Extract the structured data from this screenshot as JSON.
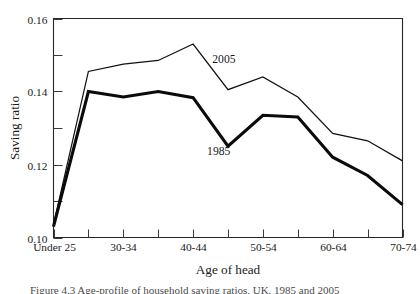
{
  "figure": {
    "caption_partial": "Figure 4.3  Age-profile of household saving ratios, UK, 1985 and 2005"
  },
  "chart_data": {
    "type": "line",
    "title": "",
    "xlabel": "Age of head",
    "ylabel": "Saving ratio",
    "grid": false,
    "legend": "inline-labels",
    "xlim": [
      0,
      10
    ],
    "ylim": [
      0.1,
      0.16
    ],
    "ytick_values": [
      0.1,
      0.12,
      0.14,
      0.16
    ],
    "ytick_labels": [
      "0.10",
      "0.12",
      "0.14",
      "0.16"
    ],
    "yminor_values": [
      0.11,
      0.13,
      0.15
    ],
    "categories": [
      "Under 25",
      "25-29",
      "30-34",
      "35-39",
      "40-44",
      "45-49",
      "50-54",
      "55-59",
      "60-64",
      "65-69",
      "70-74"
    ],
    "xtick_labels_shown": [
      "Under 25",
      "",
      "30-34",
      "",
      "40-44",
      "",
      "50-54",
      "",
      "60-64",
      "",
      "70-74"
    ],
    "series": [
      {
        "name": "2005",
        "style": "thin",
        "label_text": "2005",
        "values": [
          0.1035,
          0.1455,
          0.1475,
          0.1485,
          0.153,
          0.1405,
          0.144,
          0.1385,
          0.1285,
          0.1265,
          0.121
        ]
      },
      {
        "name": "1985",
        "style": "thick",
        "label_text": "1985",
        "values": [
          0.103,
          0.14,
          0.1385,
          0.14,
          0.1383,
          0.125,
          0.1335,
          0.133,
          0.122,
          0.117,
          0.109
        ]
      }
    ],
    "annotations": [
      {
        "text": "2005",
        "x_index": 4.55,
        "y_value": 0.1478
      },
      {
        "text": "1985",
        "x_index": 4.4,
        "y_value": 0.1225
      }
    ],
    "colors": {
      "line": "#111111",
      "axis": "#262626",
      "text": "#1a1a1a",
      "background": "#ffffff"
    }
  }
}
